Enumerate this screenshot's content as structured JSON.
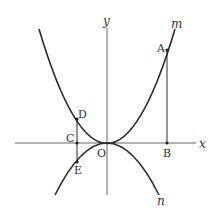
{
  "diagram": {
    "type": "coordinate-graph",
    "colors": {
      "ink": "#2a2a2a",
      "background": "#ffffff"
    },
    "axes": {
      "x_label": "x",
      "y_label": "y",
      "origin_label": "O"
    },
    "curves": [
      {
        "name": "m",
        "label": "m",
        "equation": "y = a x^2 (a > 0)",
        "opens": "up"
      },
      {
        "name": "n",
        "label": "n",
        "equation": "y = b x^2 (b < 0)",
        "opens": "down"
      }
    ],
    "points": [
      {
        "label": "A",
        "on": "m",
        "description": "point on curve m, right side"
      },
      {
        "label": "B",
        "on": "x-axis",
        "description": "foot of vertical from A"
      },
      {
        "label": "C",
        "on": "x-axis",
        "description": "left of origin"
      },
      {
        "label": "D",
        "on": "m",
        "description": "above C on curve m"
      },
      {
        "label": "E",
        "on": "n",
        "description": "below C on curve n"
      }
    ],
    "segments": [
      "AB",
      "DE"
    ]
  }
}
